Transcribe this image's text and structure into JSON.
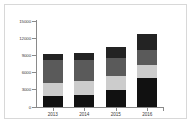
{
  "chart_data": {
    "type": "bar",
    "stacked": true,
    "title": "",
    "subtitle": "",
    "xlabel": "",
    "ylabel": "",
    "categories": [
      "2013",
      "2014",
      "2015",
      "2016"
    ],
    "ylim": [
      0,
      15000
    ],
    "ytick_labels": [
      "15000",
      "12000",
      "9000",
      "6000",
      "3000",
      "0"
    ],
    "ytick_values": [
      15000,
      12000,
      9000,
      6000,
      3000,
      0
    ],
    "grid": false,
    "legend": "none",
    "series": [
      {
        "name": "segment-1",
        "color": "#111111",
        "values": [
          2000,
          2100,
          3000,
          5000
        ]
      },
      {
        "name": "segment-2",
        "color": "#cccccc",
        "values": [
          2200,
          2400,
          2400,
          2300
        ]
      },
      {
        "name": "segment-3",
        "color": "#5a5a5a",
        "values": [
          4000,
          3700,
          3100,
          2700
        ]
      },
      {
        "name": "segment-4",
        "color": "#232323",
        "values": [
          1100,
          1200,
          2000,
          2800
        ]
      }
    ],
    "totals": [
      9300,
      9400,
      10500,
      12800
    ]
  },
  "colors": {
    "background": "#ffffff",
    "frame": "#d8d8d8",
    "axis": "#8a8a8a",
    "tick_text": "#3a3a3a"
  }
}
